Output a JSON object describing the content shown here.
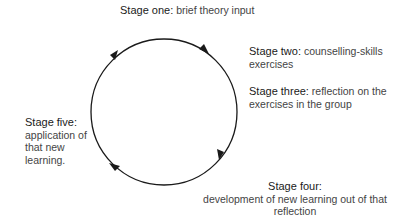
{
  "diagram": {
    "type": "cycle",
    "direction": "clockwise",
    "stages": [
      {
        "title": "Stage one:",
        "description": "brief theory input"
      },
      {
        "title": "Stage two:",
        "description": "counselling-skills exercises"
      },
      {
        "title": "Stage three:",
        "description": "reflection on the exercises in the group"
      },
      {
        "title": "Stage four:",
        "description": "development of new learning out of that reflection"
      },
      {
        "title": "Stage five:",
        "description": "application of that new learning."
      }
    ],
    "colors": {
      "line": "#1a1a1a",
      "text": "#444444",
      "background": "#ffffff"
    }
  }
}
